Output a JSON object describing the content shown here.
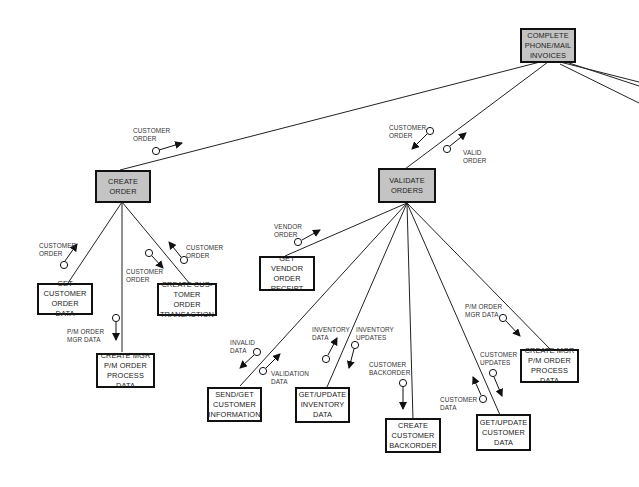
{
  "diagram": {
    "type": "structure-chart",
    "modules": [
      {
        "id": "complete",
        "label": "COMPLETE\nPHONE/MAIL\nINVOICES",
        "shaded": true
      },
      {
        "id": "create_order",
        "label": "CREATE\nORDER",
        "shaded": true
      },
      {
        "id": "validate_orders",
        "label": "VALIDATE\nORDERS",
        "shaded": true
      },
      {
        "id": "get_cust_order",
        "label": "GET\nCUSTOMER\nORDER DATA",
        "shaded": false
      },
      {
        "id": "create_mgr_1",
        "label": "CREATE MGR\nP/M ORDER\nPROCESS DATA",
        "shaded": false
      },
      {
        "id": "create_cust_txn",
        "label": "CREATE CUS-\nTOMER ORDER\nTRANSACTION",
        "shaded": false
      },
      {
        "id": "get_vendor",
        "label": "GET VENDOR\nORDER\nRECEIPT",
        "shaded": false
      },
      {
        "id": "send_get",
        "label": "SEND/GET\nCUSTOMER\nINFORMATION",
        "shaded": false
      },
      {
        "id": "get_update_inv",
        "label": "GET/UPDATE\nINVENTORY\nDATA",
        "shaded": false
      },
      {
        "id": "create_backorder",
        "label": "CREATE\nCUSTOMER\nBACKORDER",
        "shaded": false
      },
      {
        "id": "get_update_cust",
        "label": "GET/UPDATE\nCUSTOMER\nDATA",
        "shaded": false
      },
      {
        "id": "create_mgr_2",
        "label": "CREATE MGR\nP/M ORDER\nPROCESS DATA",
        "shaded": false
      }
    ],
    "couples": [
      {
        "id": "c1",
        "label": "CUSTOMER\nORDER"
      },
      {
        "id": "c2",
        "label": "CUSTOMER\nORDER"
      },
      {
        "id": "c3",
        "label": "VALID\nORDER"
      },
      {
        "id": "c4",
        "label": "CUSTOMER\nORDER"
      },
      {
        "id": "c5",
        "label": "P/M ORDER\nMGR DATA"
      },
      {
        "id": "c6",
        "label": "CUSTOMER\nORDER"
      },
      {
        "id": "c7",
        "label": "CUSTOMER\nORDER"
      },
      {
        "id": "c8",
        "label": "VENDOR\nORDER"
      },
      {
        "id": "c9",
        "label": "INVALID\nDATA"
      },
      {
        "id": "c10",
        "label": "VALIDATION\nDATA"
      },
      {
        "id": "c11",
        "label": "INVENTORY\nDATA"
      },
      {
        "id": "c12",
        "label": "INVENTORY\nUPDATES"
      },
      {
        "id": "c13",
        "label": "CUSTOMER\nBACKORDER"
      },
      {
        "id": "c14",
        "label": "CUSTOMER\nUPDATES"
      },
      {
        "id": "c15",
        "label": "CUSTOMER\nDATA"
      },
      {
        "id": "c16",
        "label": "P/M ORDER\nMGR DATA"
      }
    ]
  }
}
